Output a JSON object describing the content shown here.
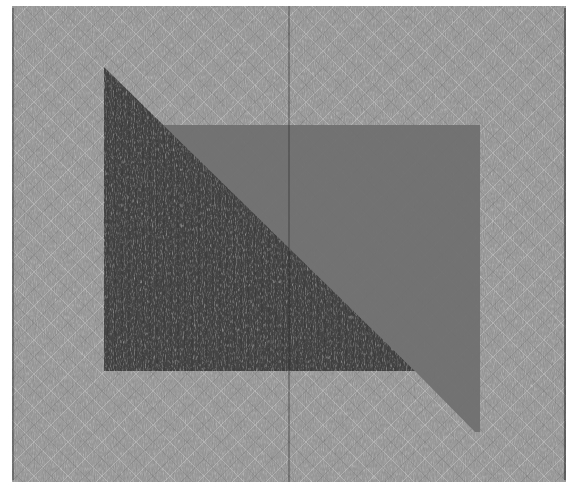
{
  "image": {
    "subject": "quilt",
    "description": "Photograph of a whole-cloth gray quilt with dense diagonal crosshatch quilting, featuring a dark gray right triangle overlapping a medium gray rectangle on a light gray textured field",
    "colors": {
      "background": "#ffffff",
      "field": "#9a9a9a",
      "field_highlight": "#b8b8b8",
      "rectangle": "#707070",
      "triangle": "#464646",
      "shadow_line": "#2e2e2e"
    },
    "shapes": [
      {
        "name": "quilt-field",
        "bounds": [
          12,
          6,
          566,
          482
        ]
      },
      {
        "name": "gray-rectangle",
        "points": [
          [
            163,
            125
          ],
          [
            480,
            125
          ],
          [
            480,
            432
          ],
          [
            475,
            432
          ],
          [
            415,
            371
          ],
          [
            163,
            371
          ]
        ]
      },
      {
        "name": "dark-triangle",
        "points": [
          [
            104,
            67
          ],
          [
            104,
            371
          ],
          [
            415,
            371
          ]
        ]
      }
    ]
  }
}
